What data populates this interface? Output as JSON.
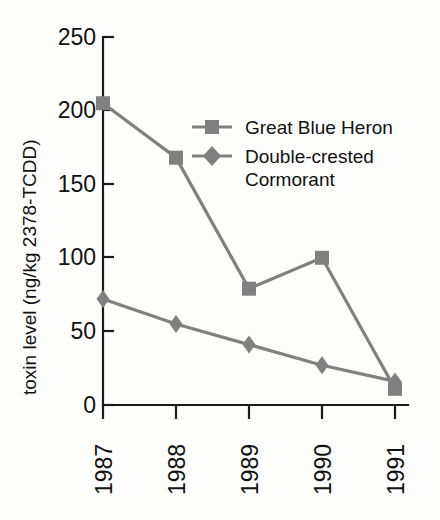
{
  "chart_data": {
    "type": "line",
    "title": "",
    "xlabel": "",
    "ylabel": "toxin level (ng/kg 2378-TCDD)",
    "categories": [
      "1987",
      "1988",
      "1989",
      "1990",
      "1991"
    ],
    "x": [
      1987,
      1988,
      1989,
      1990,
      1991
    ],
    "xlim": [
      1987,
      1991
    ],
    "ylim": [
      0,
      250
    ],
    "yticks": [
      0,
      50,
      100,
      150,
      200,
      250
    ],
    "ytick_labels": [
      "0",
      "50",
      "100",
      "150",
      "200",
      "250"
    ],
    "grid": false,
    "legend_position": "upper-center-right",
    "xtick_rotation": 90,
    "series": [
      {
        "name": "Great Blue Heron",
        "marker": "square",
        "color": "#808080",
        "values": [
          205,
          168,
          79,
          100,
          11
        ]
      },
      {
        "name": "Double-crested Cormorant",
        "marker": "diamond",
        "color": "#808080",
        "values": [
          72,
          55,
          41,
          27,
          16
        ]
      }
    ]
  },
  "axis": {
    "y_label": "toxin level (ng/kg 2378-TCDD)",
    "y_ticks": [
      "250",
      "200",
      "150",
      "100",
      "50",
      "0"
    ],
    "x_ticks": [
      "1987",
      "1988",
      "1989",
      "1990",
      "1991"
    ],
    "axis_color": "#1a1a1a"
  },
  "legend": {
    "entries": [
      {
        "label": "Great Blue Heron",
        "marker": "square-marker",
        "color": "#808080"
      },
      {
        "label_line1": "Double-crested",
        "label_line2": "Cormorant",
        "marker": "diamond-marker",
        "color": "#808080"
      }
    ]
  },
  "colors": {
    "series": "#808080",
    "axis": "#1a1a1a",
    "background": "#fdfdfc"
  }
}
